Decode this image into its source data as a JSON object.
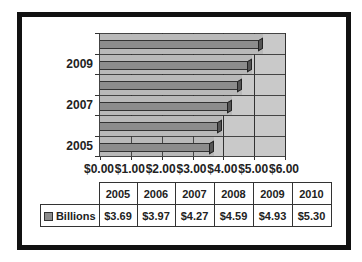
{
  "chart_data": {
    "type": "bar",
    "orientation": "horizontal",
    "style": "3d-clustered-bar",
    "categories": [
      "2005",
      "2006",
      "2007",
      "2008",
      "2009",
      "2010"
    ],
    "series": [
      {
        "name": "Billions",
        "values": [
          3.69,
          3.97,
          4.27,
          4.59,
          4.93,
          5.3
        ]
      }
    ],
    "title": "",
    "xlabel": "",
    "ylabel": "",
    "xlim": [
      0,
      6
    ],
    "x_tick_labels": [
      "$0.00",
      "$1.00",
      "$2.00",
      "$3.00",
      "$4.00",
      "$5.00",
      "$6.00"
    ],
    "y_tick_labels_shown": [
      "2005",
      "2007",
      "2009"
    ],
    "grid": true,
    "legend_position": "data-table",
    "data_table": {
      "header": [
        "2005",
        "2006",
        "2007",
        "2008",
        "2009",
        "2010"
      ],
      "rows": [
        {
          "label": "Billions",
          "values": [
            "$3.69",
            "$3.97",
            "$4.27",
            "$4.59",
            "$4.93",
            "$5.30"
          ]
        }
      ]
    }
  },
  "colors": {
    "bar_fill": "#8c8c8c",
    "plot_background": "#c9c9c9",
    "frame_border": "#111111"
  }
}
